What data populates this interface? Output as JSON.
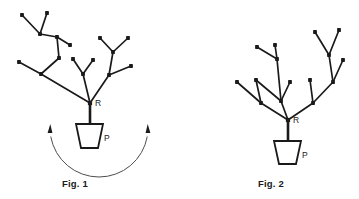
{
  "document": {
    "title": "Plant branching diagrams",
    "background_color": "#ffffff",
    "ink_color": "#1a1a1a",
    "arc_color": "#4d4d4d"
  },
  "figures": [
    {
      "id": "fig1",
      "caption": "Fig. 1",
      "caption_x": 62,
      "caption_y": 178,
      "root_label": "R",
      "root_label_x": 95,
      "root_label_y": 106,
      "pot_label": "P",
      "pot_label_x": 104,
      "pot_label_y": 141,
      "root_node": [
        90,
        103
      ],
      "stem": [
        [
          90,
          103
        ],
        [
          90,
          124
        ]
      ],
      "pot": {
        "top_left": [
          76,
          124
        ],
        "top_right": [
          103,
          124
        ],
        "bottom_right": [
          98,
          148
        ],
        "bottom_left": [
          81,
          148
        ]
      },
      "rotation_arc": {
        "present": true,
        "center": [
          99,
          128
        ],
        "radius": 49,
        "start_angle_deg": 170,
        "end_angle_deg": 10,
        "arrow_start": [
          50,
          124
        ],
        "arrow_end": [
          148,
          124
        ],
        "bidirectional": true
      },
      "edges": [
        [
          [
            90,
            103
          ],
          [
            41,
            74
          ]
        ],
        [
          [
            41,
            74
          ],
          [
            19,
            62
          ]
        ],
        [
          [
            41,
            74
          ],
          [
            59,
            58
          ]
        ],
        [
          [
            59,
            58
          ],
          [
            57,
            37
          ]
        ],
        [
          [
            57,
            37
          ],
          [
            40,
            34
          ]
        ],
        [
          [
            40,
            34
          ],
          [
            22,
            15
          ]
        ],
        [
          [
            40,
            34
          ],
          [
            47,
            13
          ]
        ],
        [
          [
            57,
            37
          ],
          [
            70,
            45
          ]
        ],
        [
          [
            90,
            103
          ],
          [
            83,
            74
          ]
        ],
        [
          [
            83,
            74
          ],
          [
            73,
            59
          ]
        ],
        [
          [
            83,
            74
          ],
          [
            93,
            60
          ]
        ],
        [
          [
            90,
            103
          ],
          [
            109,
            75
          ]
        ],
        [
          [
            109,
            75
          ],
          [
            131,
            66
          ]
        ],
        [
          [
            109,
            75
          ],
          [
            113,
            52
          ]
        ],
        [
          [
            113,
            52
          ],
          [
            100,
            38
          ]
        ],
        [
          [
            113,
            52
          ],
          [
            128,
            38
          ]
        ]
      ],
      "nodes": [
        [
          19,
          62
        ],
        [
          22,
          15
        ],
        [
          47,
          13
        ],
        [
          70,
          45
        ],
        [
          73,
          59
        ],
        [
          93,
          60
        ],
        [
          131,
          66
        ],
        [
          100,
          38
        ],
        [
          128,
          38
        ],
        [
          41,
          74
        ],
        [
          59,
          58
        ],
        [
          57,
          37
        ],
        [
          40,
          34
        ],
        [
          83,
          74
        ],
        [
          109,
          75
        ],
        [
          113,
          52
        ]
      ]
    },
    {
      "id": "fig2",
      "caption": "Fig. 2",
      "caption_x": 258,
      "caption_y": 178,
      "root_label": "R",
      "root_label_x": 293,
      "root_label_y": 123,
      "pot_label": "P",
      "pot_label_x": 302,
      "pot_label_y": 158,
      "root_node": [
        288,
        120
      ],
      "stem": [
        [
          288,
          120
        ],
        [
          288,
          141
        ]
      ],
      "pot": {
        "top_left": [
          274,
          141
        ],
        "top_right": [
          301,
          141
        ],
        "bottom_right": [
          296,
          164
        ],
        "bottom_left": [
          279,
          164
        ]
      },
      "rotation_arc": {
        "present": false
      },
      "edges": [
        [
          [
            288,
            120
          ],
          [
            261,
            103
          ]
        ],
        [
          [
            261,
            103
          ],
          [
            237,
            82
          ]
        ],
        [
          [
            261,
            103
          ],
          [
            256,
            80
          ]
        ],
        [
          [
            288,
            120
          ],
          [
            281,
            101
          ]
        ],
        [
          [
            281,
            101
          ],
          [
            256,
            80
          ]
        ],
        [
          [
            281,
            101
          ],
          [
            290,
            82
          ]
        ],
        [
          [
            281,
            101
          ],
          [
            277,
            59
          ]
        ],
        [
          [
            277,
            59
          ],
          [
            257,
            47
          ]
        ],
        [
          [
            277,
            59
          ],
          [
            275,
            45
          ]
        ],
        [
          [
            288,
            120
          ],
          [
            313,
            103
          ]
        ],
        [
          [
            313,
            103
          ],
          [
            310,
            80
          ]
        ],
        [
          [
            313,
            103
          ],
          [
            333,
            82
          ]
        ],
        [
          [
            333,
            82
          ],
          [
            329,
            55
          ]
        ],
        [
          [
            333,
            82
          ],
          [
            343,
            60
          ]
        ],
        [
          [
            329,
            55
          ],
          [
            315,
            32
          ]
        ],
        [
          [
            329,
            55
          ],
          [
            339,
            30
          ]
        ]
      ],
      "nodes": [
        [
          237,
          82
        ],
        [
          256,
          80
        ],
        [
          290,
          82
        ],
        [
          257,
          47
        ],
        [
          275,
          45
        ],
        [
          310,
          80
        ],
        [
          343,
          60
        ],
        [
          315,
          32
        ],
        [
          339,
          30
        ],
        [
          261,
          103
        ],
        [
          281,
          101
        ],
        [
          277,
          59
        ],
        [
          313,
          103
        ],
        [
          333,
          82
        ],
        [
          329,
          55
        ]
      ]
    }
  ]
}
